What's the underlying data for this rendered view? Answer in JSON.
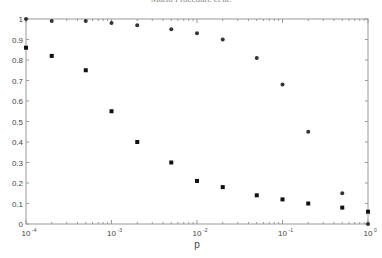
{
  "header": {
    "running_title": "Mario Procedure et al."
  },
  "chart_data": {
    "type": "scatter",
    "title": "",
    "xlabel": "p",
    "ylabel": "",
    "xscale": "log",
    "xlim": [
      0.0001,
      1
    ],
    "ylim": [
      0,
      1
    ],
    "xticks": [
      0.0001,
      0.001,
      0.01,
      0.1,
      1
    ],
    "xtick_labels": [
      "10^-4",
      "10^-3",
      "10^-2",
      "10^-1",
      "10^0"
    ],
    "yticks": [
      0,
      0.1,
      0.2,
      0.3,
      0.4,
      0.5,
      0.6,
      0.7,
      0.8,
      0.9,
      1
    ],
    "ytick_labels": [
      "0",
      "0.1",
      "0.2",
      "0.3",
      "0.4",
      "0.5",
      "0.6",
      "0.7",
      "0.8",
      "0.9",
      "1"
    ],
    "grid": false,
    "legend": null,
    "x": [
      0.0001,
      0.0002,
      0.0005,
      0.001,
      0.002,
      0.005,
      0.01,
      0.02,
      0.05,
      0.1,
      0.2,
      0.5,
      1
    ],
    "series": [
      {
        "name": "series-circles",
        "marker": "circle",
        "color": "#333333",
        "values": [
          1.0,
          0.99,
          0.99,
          0.98,
          0.97,
          0.95,
          0.93,
          0.9,
          0.81,
          0.68,
          0.45,
          0.15,
          0.0
        ]
      },
      {
        "name": "series-squares",
        "marker": "square",
        "color": "#111111",
        "values": [
          0.86,
          0.82,
          0.75,
          0.55,
          0.4,
          0.3,
          0.21,
          0.18,
          0.14,
          0.12,
          0.1,
          0.08,
          0.06
        ]
      }
    ]
  }
}
